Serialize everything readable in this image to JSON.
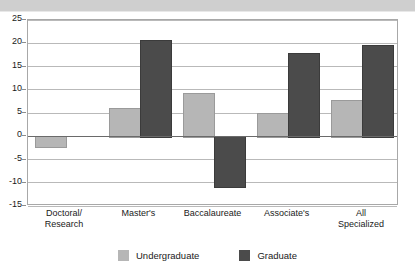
{
  "chart_data": {
    "type": "bar",
    "title": "",
    "subtitle": "",
    "xlabel": "",
    "ylabel": "",
    "ylim": [
      -15,
      25
    ],
    "ytick_step": 5,
    "yticks": [
      25,
      20,
      15,
      10,
      5,
      0,
      -5,
      -10,
      -15
    ],
    "ytick_labels": [
      "25",
      "20",
      "15",
      "10",
      "5",
      "0",
      "-5",
      "-10",
      "-15"
    ],
    "grid": true,
    "zero_line": true,
    "legend_position": "bottom-center",
    "categories": [
      [
        "Doctoral/",
        "Research"
      ],
      [
        "Master's"
      ],
      [
        "Baccalaureate"
      ],
      [
        "Associate's"
      ],
      [
        "All",
        "Specialized"
      ]
    ],
    "series": [
      {
        "name": "Undergraduate",
        "color": "#b6b6b6",
        "values": [
          -2.0,
          6.0,
          9.4,
          4.9,
          7.7
        ]
      },
      {
        "name": "Graduate",
        "color": "#4b4b4b",
        "values": [
          0.0,
          20.8,
          -10.8,
          17.8,
          19.7
        ]
      }
    ]
  },
  "colors": {
    "undergraduate": "#b6b6b6",
    "graduate": "#4b4b4b",
    "gridline": "#b9b9b9",
    "axis": "#a8a8a8",
    "zero_line": "#6a6a6a",
    "banner": "#cfcfcf"
  }
}
